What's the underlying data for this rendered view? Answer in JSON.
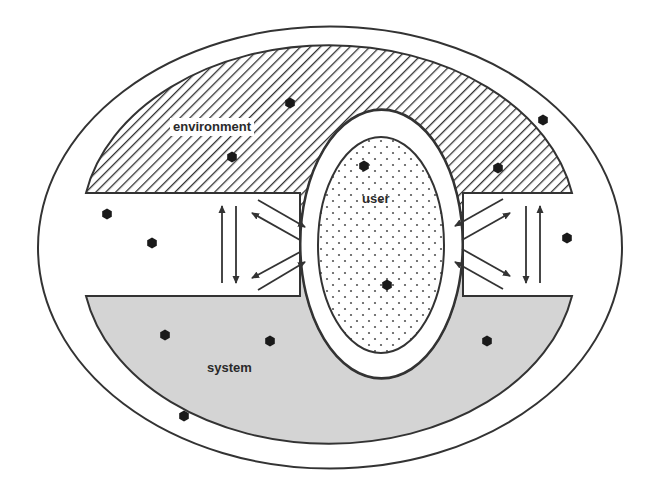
{
  "diagram": {
    "regions": [
      {
        "id": "outer",
        "label": "",
        "fill": "#ffffff",
        "stroke": "#333333"
      },
      {
        "id": "environment",
        "label": "environment",
        "fill": "hatched",
        "stroke": "#333333"
      },
      {
        "id": "user",
        "label": "user",
        "fill": "dotted",
        "stroke": "#333333"
      },
      {
        "id": "system",
        "label": "system",
        "fill": "#d4d4d4",
        "stroke": "#333333"
      }
    ],
    "labels": {
      "environment": "environment",
      "user": "user",
      "system": "system"
    },
    "dots": [
      [
        290,
        103
      ],
      [
        543,
        120
      ],
      [
        232,
        157
      ],
      [
        364,
        166
      ],
      [
        498,
        168
      ],
      [
        107,
        214
      ],
      [
        152,
        243
      ],
      [
        567,
        238
      ],
      [
        387,
        285
      ],
      [
        165,
        335
      ],
      [
        270,
        341
      ],
      [
        487,
        341
      ],
      [
        184,
        416
      ]
    ],
    "arrows": {
      "left_vertical": [
        {
          "from": [
            222,
            283
          ],
          "to": [
            222,
            206
          ]
        },
        {
          "from": [
            236,
            206
          ],
          "to": [
            236,
            283
          ]
        }
      ],
      "left_diagonal": [
        {
          "from": [
            258,
            200
          ],
          "to": [
            305,
            227
          ]
        },
        {
          "from": [
            300,
            240
          ],
          "to": [
            252,
            213
          ]
        },
        {
          "from": [
            300,
            252
          ],
          "to": [
            252,
            278
          ]
        },
        {
          "from": [
            258,
            290
          ],
          "to": [
            305,
            262
          ]
        }
      ],
      "right_vertical": [
        {
          "from": [
            526,
            206
          ],
          "to": [
            526,
            283
          ]
        },
        {
          "from": [
            540,
            283
          ],
          "to": [
            540,
            206
          ]
        }
      ],
      "right_diagonal": [
        {
          "from": [
            503,
            199
          ],
          "to": [
            455,
            226
          ]
        },
        {
          "from": [
            462,
            240
          ],
          "to": [
            510,
            213
          ]
        },
        {
          "from": [
            462,
            249
          ],
          "to": [
            510,
            276
          ]
        },
        {
          "from": [
            503,
            289
          ],
          "to": [
            455,
            262
          ]
        }
      ]
    },
    "colors": {
      "stroke": "#333333",
      "system_fill": "#d4d4d4",
      "dot": "#1a1a1a",
      "background": "#ffffff"
    }
  }
}
